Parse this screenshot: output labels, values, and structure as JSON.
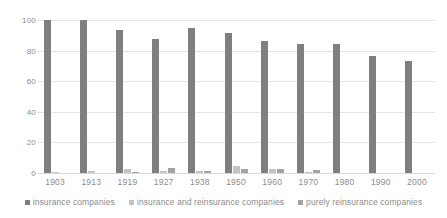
{
  "chart_data": {
    "type": "bar",
    "title": "",
    "subtitle": "",
    "xlabel": "",
    "ylabel": "",
    "categories": [
      "1903",
      "1913",
      "1919",
      "1927",
      "1938",
      "1950",
      "1960",
      "1970",
      "1980",
      "1990",
      "2000"
    ],
    "series": [
      {
        "name": "insurance companies",
        "color": "#7f7f7f",
        "values": [
          100,
          100,
          93.5,
          87.5,
          95,
          91.5,
          86,
          84.5,
          84,
          76.5,
          73.5
        ]
      },
      {
        "name": "insurance and reinsurance companies",
        "color": "#c3c3c3",
        "values": [
          0.5,
          1.5,
          2.5,
          1,
          1.5,
          4.5,
          2.5,
          0.5,
          0,
          0,
          0
        ]
      },
      {
        "name": "purely reinsurance companies",
        "color": "#a3a3a3",
        "values": [
          0,
          0,
          0.5,
          3.5,
          1.5,
          2.5,
          2.5,
          2,
          0,
          0,
          0
        ]
      }
    ],
    "ylim": [
      0,
      100
    ],
    "yticks": [
      "100",
      "80",
      "60",
      "40",
      "20",
      "0"
    ],
    "ytick_values": [
      100,
      80,
      60,
      40,
      20,
      0
    ],
    "grid": true,
    "legend_position": "bottom",
    "legend": [
      "insurance companies",
      "insurance and reinsurance companies",
      "purely reinsurance companies"
    ]
  }
}
